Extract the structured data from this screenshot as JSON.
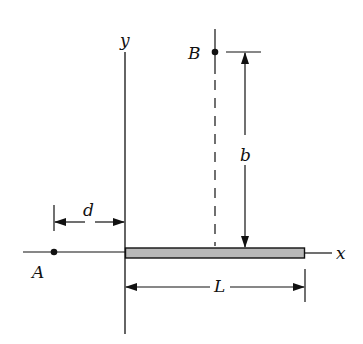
{
  "diagram": {
    "axes": {
      "x_label": "x",
      "y_label": "y"
    },
    "points": [
      {
        "id": "A",
        "label": "A"
      },
      {
        "id": "B",
        "label": "B"
      }
    ],
    "rod": {
      "label": "rod along x-axis",
      "fill": "#b8b8b8"
    },
    "dimensions": {
      "d": "d",
      "b": "b",
      "L": "L"
    },
    "colors": {
      "line": "#111111",
      "rod_fill": "#b8b8b8",
      "background": "#ffffff"
    }
  }
}
